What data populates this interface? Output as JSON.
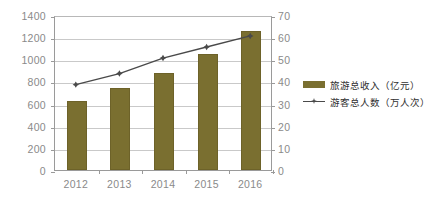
{
  "chart_data": {
    "type": "bar",
    "title": "",
    "subtitle": "",
    "xlabel": "",
    "ylabel": "",
    "grid": true,
    "legend_position": "right",
    "categories": [
      "2012",
      "2013",
      "2014",
      "2015",
      "2016"
    ],
    "axes": {
      "left": {
        "ylim": [
          0,
          1400
        ],
        "step": 200,
        "ticks": [
          "0",
          "200",
          "400",
          "600",
          "800",
          "1000",
          "1200",
          "1400"
        ],
        "unit": "亿元"
      },
      "right": {
        "ylim": [
          0,
          70
        ],
        "step": 10,
        "ticks": [
          "0",
          "10",
          "20",
          "30",
          "40",
          "50",
          "60",
          "70"
        ],
        "unit": "万人次"
      }
    },
    "series": [
      {
        "name": "旅游总收入（亿元）",
        "type": "bar",
        "axis": "left",
        "color": "#7a6f30",
        "values": [
          620,
          745,
          880,
          1050,
          1260
        ]
      },
      {
        "name": "游客总人数（万人次）",
        "type": "line",
        "axis": "right",
        "color": "#4a4a4a",
        "marker": "diamond",
        "values": [
          39,
          44,
          51,
          56,
          61
        ]
      }
    ]
  },
  "legend": {
    "items": [
      {
        "label": "旅游总收入（亿元）",
        "swatch": "bar-swatch",
        "color": "#7a6f30"
      },
      {
        "label": "游客总人数（万人次）",
        "swatch": "line-marker-swatch",
        "color": "#4a4a4a"
      }
    ]
  },
  "colors": {
    "bar": "#7a6f30",
    "line": "#4a4a4a",
    "grid": "#c9c9c9",
    "axis": "#9a9a9a",
    "tick_text": "#8a8a8a",
    "background": "#ffffff"
  }
}
